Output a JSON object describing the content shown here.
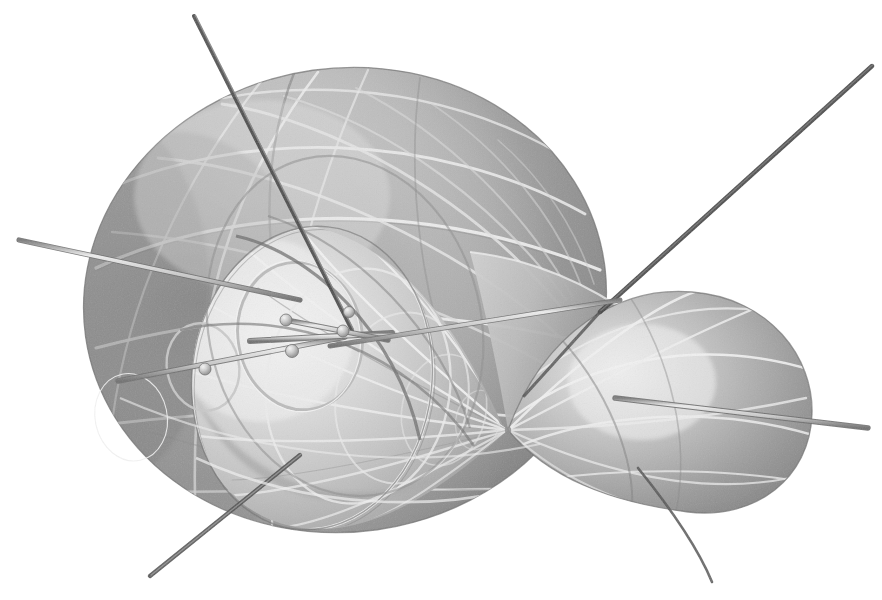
{
  "figure": {
    "title": "Horn cyclide (inverted torus) surface model",
    "style": "grayscale airbrush / halftone plate illustration",
    "background_color": "#ffffff",
    "canvas": {
      "width": 882,
      "height": 600
    },
    "surface_type": "Dupin cyclide with two lobes joined at a singular pinch point"
  },
  "palette": {
    "background": "#ffffff",
    "surface_light": "#e2e2e2",
    "surface_mid": "#b4b4b4",
    "surface_dark": "#7d7d7d",
    "surface_shadow": "#636363",
    "curve_light": "#f2f2f2",
    "curve_dark": "#5a5a5a",
    "rod_light": "#d9d9d9",
    "rod_dark": "#4f4f4f",
    "rod_edge": "#6e6e6e",
    "bead": "#cfcfcf",
    "outline": "#6a6a6a"
  },
  "components": {
    "big_lobe": {
      "name": "large left lobe",
      "center": [
        345,
        300
      ],
      "radius_x": 262,
      "radius_y": 232,
      "rotation_deg": -8,
      "highlight": [
        250,
        215
      ]
    },
    "small_lobe": {
      "name": "small right teardrop lobe",
      "center": [
        690,
        398
      ],
      "radius_x": 122,
      "radius_y": 108,
      "rotation_deg": -22,
      "highlight": [
        645,
        380
      ]
    },
    "inner_horn": {
      "name": "inner funnel / horn surface",
      "mouth_center": [
        312,
        378
      ],
      "mouth_radius_x": 120,
      "mouth_radius_y": 152,
      "apex": [
        508,
        430
      ]
    },
    "pinch_point": {
      "name": "singular pinch point",
      "position": [
        508,
        430
      ]
    }
  },
  "curve_families": {
    "meridians_count": 14,
    "parallels_count": 9,
    "inner_meridians_count": 13,
    "description": "two orthogonal families of circles (lines of curvature) drawn as light and dark ribbons across both lobes"
  },
  "rods": [
    {
      "id": "rod-top-left",
      "label": "upper-left tangent rod",
      "from": [
        194,
        16
      ],
      "to": [
        352,
        330
      ],
      "tone": "dark",
      "width": 3.4
    },
    {
      "id": "rod-top-right",
      "label": "upper-right tangent rod",
      "from": [
        872,
        66
      ],
      "to": [
        600,
        312
      ],
      "tone": "dark",
      "width": 4.0
    },
    {
      "id": "rod-left",
      "label": "left horizontal rod",
      "from": [
        19,
        240
      ],
      "to": [
        300,
        300
      ],
      "tone": "light",
      "width": 4.2
    },
    {
      "id": "rod-mid-left",
      "label": "mid-left short rod",
      "from": [
        118,
        381
      ],
      "to": [
        345,
        337
      ],
      "tone": "light",
      "width": 4.4
    },
    {
      "id": "rod-mid-center",
      "label": "central short rod",
      "from": [
        250,
        341
      ],
      "to": [
        392,
        333
      ],
      "tone": "light",
      "width": 5.0
    },
    {
      "id": "rod-bead-upper",
      "label": "upper bead rod",
      "from": [
        286,
        320
      ],
      "to": [
        388,
        340
      ],
      "tone": "light",
      "width": 5.0
    },
    {
      "id": "rod-to-pinch",
      "label": "rod through inner horn",
      "from": [
        330,
        346
      ],
      "to": [
        620,
        300
      ],
      "tone": "light",
      "width": 4.2
    },
    {
      "id": "rod-right",
      "label": "right exit rod",
      "from": [
        615,
        398
      ],
      "to": [
        868,
        428
      ],
      "tone": "light",
      "width": 4.6
    },
    {
      "id": "rod-bottom-left",
      "label": "bottom-left exit rod",
      "from": [
        300,
        455
      ],
      "to": [
        150,
        576
      ],
      "tone": "dark",
      "width": 3.8
    },
    {
      "id": "rod-bottom-right",
      "label": "bottom-right exit rod",
      "from": [
        640,
        470
      ],
      "to": [
        712,
        580
      ],
      "tone": "dark",
      "width": 2.8
    }
  ],
  "beads": [
    {
      "id": "bead-left",
      "label": "left bead marker",
      "position": [
        205,
        369
      ],
      "radius": 6.0
    },
    {
      "id": "bead-center",
      "label": "center bead marker",
      "position": [
        292,
        351
      ],
      "radius": 6.5
    },
    {
      "id": "bead-upper",
      "label": "upper bead marker",
      "position": [
        286,
        320
      ],
      "radius": 6.0
    },
    {
      "id": "bead-upper-right",
      "label": "upper-right bead marker",
      "position": [
        343,
        331
      ],
      "radius": 6.0
    },
    {
      "id": "bead-right",
      "label": "right bead marker",
      "position": [
        349,
        312
      ],
      "radius": 5.5
    }
  ],
  "small_circles": [
    {
      "id": "circle-small-left",
      "label": "small tangent circle (left)",
      "center": [
        203,
        367
      ],
      "radius_x": 36,
      "radius_y": 44,
      "rotation_deg": -12
    },
    {
      "id": "circle-mouth",
      "label": "horn mouth circle",
      "center": [
        312,
        378
      ],
      "radius_x": 120,
      "radius_y": 152,
      "rotation_deg": 6
    },
    {
      "id": "circle-inner-ring",
      "label": "inner characteristic circle",
      "center": [
        300,
        336
      ],
      "radius_x": 62,
      "radius_y": 74,
      "rotation_deg": -10
    }
  ]
}
